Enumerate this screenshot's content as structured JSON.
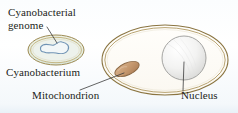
{
  "figure": {
    "background_color": "#fbfdfe"
  },
  "labels": {
    "cyanobacterial_genome_line1": "Cyanobacterial",
    "cyanobacterial_genome_line2": "genome",
    "cyanobacterium": "Cyanobacterium",
    "mitochondrion": "Mitochondrion",
    "nucleus": "Nucleus"
  },
  "structures": {
    "cyanobacterium": {
      "name": "cyanobacterium",
      "shape": "ellipse",
      "cx": 56,
      "cy": 50,
      "rx": 28,
      "ry": 15,
      "fill": "#e8eee0",
      "wall_outer": "#9c8a52",
      "wall_inner": "#b6a46a"
    },
    "cyanobacterial_genome": {
      "name": "cyanobacterial-genome",
      "shape": "closed-irregular-loop",
      "stroke": "#6f93b4",
      "fill": "#eef4f6"
    },
    "host_cell": {
      "name": "host-cell",
      "shape": "ellipse",
      "cx": 165,
      "cy": 60,
      "rx": 63,
      "ry": 35,
      "fill": "#fdfcf8",
      "membrane_outer": "#8a7440",
      "membrane_inner": "#a8915a"
    },
    "mitochondrion": {
      "name": "mitochondrion",
      "shape": "tilted-ellipse",
      "cx": 127,
      "cy": 69,
      "rx": 13,
      "ry": 6,
      "rotation_deg": -24,
      "fill": "#c79a72",
      "stroke": "#8e6a46"
    },
    "nucleus": {
      "name": "nucleus",
      "shape": "sphere",
      "cx": 184,
      "cy": 58,
      "r": 22,
      "fill": "#f1f1f0",
      "stroke": "#9a9a98"
    }
  },
  "leader_lines": {
    "genome_leader": {
      "from_label": "cyanobacterial_genome",
      "to_structure": "cyanobacterial_genome",
      "stroke": "#3a3a3a"
    },
    "mitochondrion_leader": {
      "from_label": "mitochondrion",
      "to_structure": "mitochondrion",
      "stroke": "#3a3a3a"
    },
    "nucleus_leader": {
      "from_label": "nucleus",
      "to_structure": "nucleus",
      "stroke": "#3a3a3a"
    }
  }
}
